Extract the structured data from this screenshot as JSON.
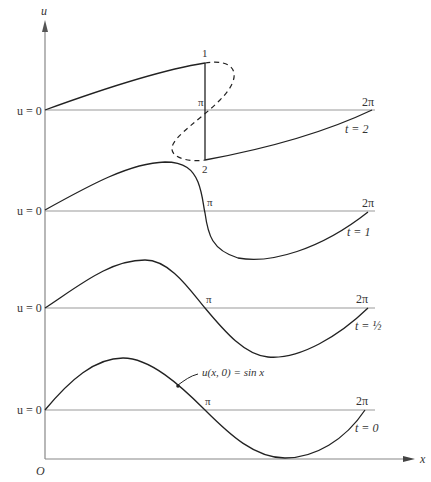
{
  "figure": {
    "axis_labels": {
      "y": "u",
      "x": "x",
      "origin": "O"
    },
    "panels": [
      {
        "id": "t2",
        "baseline_label": "u = 0",
        "pi_label": "π",
        "two_pi_label": "2π",
        "time_label": "t = 2",
        "shock_top_label": "1",
        "shock_bottom_label": "2"
      },
      {
        "id": "t1",
        "baseline_label": "u = 0",
        "pi_label": "π",
        "two_pi_label": "2π",
        "time_label": "t = 1"
      },
      {
        "id": "thalf",
        "baseline_label": "u = 0",
        "pi_label": "π",
        "two_pi_label": "2π",
        "time_label": "t = ½"
      },
      {
        "id": "t0",
        "baseline_label": "u = 0",
        "pi_label": "π",
        "two_pi_label": "2π",
        "time_label": "t = 0",
        "curve_annotation": "u(x, 0) = sin x"
      }
    ],
    "colors": {
      "curve": "#222222",
      "baseline": "#999999",
      "axis": "#888888",
      "text": "#333333"
    }
  }
}
